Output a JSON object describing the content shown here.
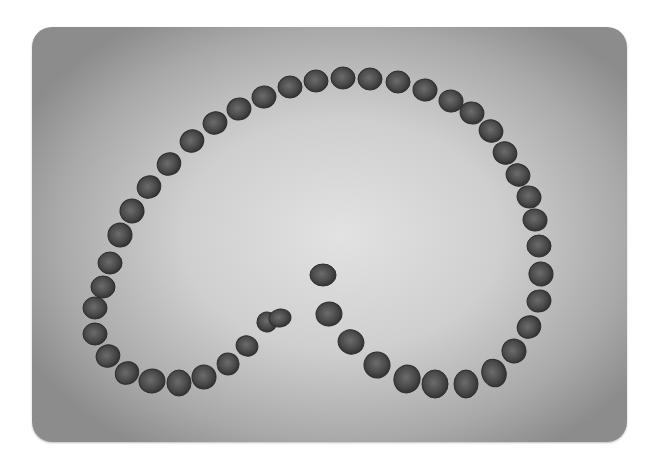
{
  "image": {
    "subject": "beans-arranged-in-spiral",
    "description": "Grayscale photo of dark beans arranged in a large open loop / spiral on a gray vignetted surface",
    "colors": {
      "background_center": "#e2e2e2",
      "background_edge": "#8c8c8c",
      "bean_fill": "#4a4a4a",
      "bean_edge": "#2e2e2e",
      "bean_highlight": "#6c6c6c"
    },
    "beans": [
      [
        63,
        281,
        12,
        11,
        0
      ],
      [
        63,
        307,
        12,
        11,
        0
      ],
      [
        76,
        329,
        12,
        11,
        -25
      ],
      [
        95,
        346,
        12,
        11,
        -35
      ],
      [
        120,
        354,
        13,
        12,
        -10
      ],
      [
        147,
        356,
        12,
        13,
        0
      ],
      [
        172,
        350,
        12,
        12,
        10
      ],
      [
        196,
        337,
        11,
        11,
        20
      ],
      [
        215,
        319,
        11,
        10,
        20
      ],
      [
        235,
        295,
        10,
        10,
        20
      ],
      [
        248,
        291,
        11,
        9,
        -10
      ],
      [
        291,
        248,
        13,
        11,
        0
      ],
      [
        297,
        287,
        13,
        12,
        -10
      ],
      [
        319,
        315,
        13,
        12,
        20
      ],
      [
        345,
        338,
        13,
        13,
        25
      ],
      [
        375,
        352,
        13,
        14,
        15
      ],
      [
        403,
        357,
        13,
        14,
        0
      ],
      [
        434,
        357,
        12,
        14,
        0
      ],
      [
        462,
        346,
        12,
        14,
        -20
      ],
      [
        482,
        324,
        12,
        12,
        -35
      ],
      [
        497,
        300,
        12,
        11,
        -30
      ],
      [
        507,
        274,
        12,
        11,
        -15
      ],
      [
        509,
        247,
        12,
        12,
        -5
      ],
      [
        507,
        219,
        12,
        11,
        0
      ],
      [
        503,
        193,
        12,
        11,
        10
      ],
      [
        497,
        170,
        12,
        11,
        15
      ],
      [
        486,
        148,
        12,
        11,
        20
      ],
      [
        473,
        126,
        12,
        11,
        25
      ],
      [
        459,
        104,
        12,
        11,
        25
      ],
      [
        440,
        86,
        12,
        11,
        15
      ],
      [
        419,
        74,
        12,
        11,
        10
      ],
      [
        393,
        63,
        12,
        11,
        5
      ],
      [
        366,
        55,
        12,
        11,
        0
      ],
      [
        338,
        52,
        12,
        11,
        0
      ],
      [
        311,
        51,
        12,
        11,
        0
      ],
      [
        284,
        54,
        12,
        11,
        0
      ],
      [
        258,
        60,
        12,
        11,
        0
      ],
      [
        232,
        70,
        12,
        11,
        -10
      ],
      [
        207,
        82,
        12,
        11,
        -15
      ],
      [
        183,
        96,
        12,
        11,
        -20
      ],
      [
        160,
        114,
        12,
        11,
        -25
      ],
      [
        137,
        137,
        12,
        11,
        -30
      ],
      [
        117,
        160,
        12,
        11,
        -30
      ],
      [
        100,
        184,
        12,
        12,
        -20
      ],
      [
        88,
        208,
        12,
        12,
        -10
      ],
      [
        78,
        236,
        12,
        11,
        0
      ],
      [
        71,
        260,
        12,
        11,
        0
      ]
    ]
  }
}
